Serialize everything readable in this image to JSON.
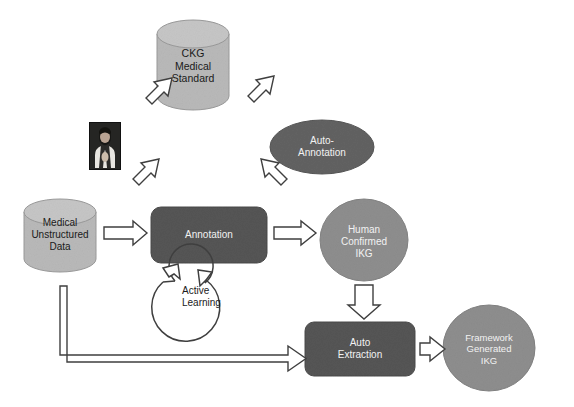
{
  "diagram": {
    "type": "flow-diagram",
    "background_color": "#ffffff",
    "palette": {
      "light_gray_fill": "#b9b9b9",
      "mid_gray_fill": "#8e8e8e",
      "dark_gray_fill": "#4d4d4d",
      "outline": "#3a3a3a",
      "arrow_fill": "#ffffff",
      "arrow_stroke": "#3f3f3f",
      "text_dark": "#1a1a1a",
      "text_light": "#ffffff"
    },
    "nodes": [
      {
        "id": "ckg",
        "shape": "cylinder",
        "label": "CKG\nMedical\nStandard",
        "lines": [
          "CKG",
          "Medical",
          "Standard"
        ],
        "fill": "#b9b9b9",
        "text_color": "#1a1a1a"
      },
      {
        "id": "doctor",
        "shape": "photo",
        "label": "doctor-photo",
        "lines": [],
        "fill": "#20201e",
        "text_color": "#ffffff"
      },
      {
        "id": "auto-annotation",
        "shape": "ellipse",
        "label": "Auto-Annotation",
        "lines": [
          "Auto-",
          "Annotation"
        ],
        "fill": "#626262",
        "text_color": "#ffffff"
      },
      {
        "id": "medical-unstructured-data",
        "shape": "cylinder",
        "label": "Medical Unstructured Data",
        "lines": [
          "Medical",
          "Unstructured",
          "Data"
        ],
        "fill": "#b9b9b9",
        "text_color": "#1a1a1a"
      },
      {
        "id": "annotation",
        "shape": "rounded-rect",
        "label": "Annotation",
        "lines": [
          "Annotation"
        ],
        "fill": "#555555",
        "text_color": "#ffffff"
      },
      {
        "id": "human-confirmed-ikg",
        "shape": "circle",
        "label": "Human Confirmed IKG",
        "lines": [
          "Human",
          "Confirmed",
          "IKG"
        ],
        "fill": "#8e8e8e",
        "text_color": "#ffffff"
      },
      {
        "id": "active-learning",
        "shape": "circular-arrow",
        "label": "Active Learning",
        "lines": [
          "Active",
          "Learning"
        ],
        "fill": "#ffffff",
        "text_color": "#1a1a1a"
      },
      {
        "id": "auto-extraction",
        "shape": "rounded-rect",
        "label": "Auto Extraction",
        "lines": [
          "Auto",
          "Extraction"
        ],
        "fill": "#555555",
        "text_color": "#ffffff"
      },
      {
        "id": "framework-generated-ikg",
        "shape": "circle",
        "label": "Framework Generated IKG",
        "lines": [
          "Framework",
          "Generated",
          "IKG"
        ],
        "fill": "#8e8e8e",
        "text_color": "#ffffff"
      }
    ],
    "edges": [
      {
        "id": "ckg-to-doctor",
        "from": "ckg",
        "to": "doctor",
        "style": "block-arrow"
      },
      {
        "id": "ckg-to-auto-annotation",
        "from": "ckg",
        "to": "auto-annotation",
        "style": "block-arrow"
      },
      {
        "id": "doctor-to-annotation",
        "from": "doctor",
        "to": "annotation",
        "style": "block-arrow"
      },
      {
        "id": "auto-annotation-to-annotation",
        "from": "auto-annotation",
        "to": "annotation",
        "style": "block-arrow"
      },
      {
        "id": "data-to-annotation",
        "from": "medical-unstructured-data",
        "to": "annotation",
        "style": "block-arrow"
      },
      {
        "id": "annotation-to-human-ikg",
        "from": "annotation",
        "to": "human-confirmed-ikg",
        "style": "block-arrow"
      },
      {
        "id": "human-ikg-to-auto-extraction",
        "from": "human-confirmed-ikg",
        "to": "auto-extraction",
        "style": "block-arrow"
      },
      {
        "id": "auto-extraction-to-framework-ikg",
        "from": "auto-extraction",
        "to": "framework-generated-ikg",
        "style": "block-arrow"
      },
      {
        "id": "data-to-auto-extraction",
        "from": "medical-unstructured-data",
        "to": "auto-extraction",
        "style": "outline-elbow-arrow"
      },
      {
        "id": "annotation-active-learning-loop",
        "from": "annotation",
        "to": "annotation",
        "style": "circular-loop-arrow"
      }
    ]
  },
  "labels": {
    "ckg_line1": "CKG",
    "ckg_line2": "Medical",
    "ckg_line3": "Standard",
    "auto_annotation_line1": "Auto-",
    "auto_annotation_line2": "Annotation",
    "data_line1": "Medical",
    "data_line2": "Unstructured",
    "data_line3": "Data",
    "annotation": "Annotation",
    "human_line1": "Human",
    "human_line2": "Confirmed",
    "human_line3": "IKG",
    "active_line1": "Active",
    "active_line2": "Learning",
    "extraction_line1": "Auto",
    "extraction_line2": "Extraction",
    "framework_line1": "Framework",
    "framework_line2": "Generated",
    "framework_line3": "IKG"
  }
}
